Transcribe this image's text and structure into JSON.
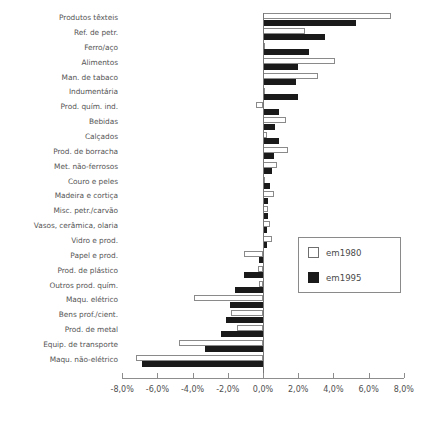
{
  "chart_data": {
    "type": "bar",
    "orientation": "horizontal",
    "title": "",
    "subtitle": "",
    "xlabel": "",
    "ylabel": "",
    "xlim": [
      -8,
      8
    ],
    "xticks": [
      -8,
      -6,
      -4,
      -2,
      0,
      2,
      4,
      6,
      8
    ],
    "xticklabels": [
      "-8,0%",
      "-6,0%",
      "-4,0%",
      "-2,0%",
      "0,0%",
      "2,0%",
      "4,0%",
      "6,0%",
      "8,0%"
    ],
    "grid": false,
    "legend_position": "center-right",
    "categories": [
      "Produtos têxteis",
      "Ref. de petr.",
      "Ferro/aço",
      "Alimentos",
      "Man. de tabaco",
      "Indumentária",
      "Prod. quím. ind.",
      "Bebidas",
      "Calçados",
      "Prod. de borracha",
      "Met. não-ferrosos",
      "Couro e peles",
      "Madeira e cortiça",
      "Misc. petr./carvão",
      "Vasos, cerâmica, olaria",
      "Vidro e prod.",
      "Papel e prod.",
      "Prod. de plástico",
      "Outros prod. quím.",
      "Maqu. elétrico",
      "Bens prof./cient.",
      "Prod. de metal",
      "Equip. de transporte",
      "Maqu. não-elétrico"
    ],
    "series": [
      {
        "name": "em1980",
        "color": "#ffffff",
        "edgecolor": "#8a8a8a",
        "values": [
          7.3,
          2.4,
          0.1,
          4.1,
          3.1,
          0.1,
          -0.4,
          1.3,
          0.2,
          1.4,
          0.8,
          0.1,
          0.6,
          0.3,
          0.4,
          0.5,
          -1.1,
          -0.3,
          -0.2,
          -3.9,
          -1.8,
          -1.5,
          -4.8,
          -7.2
        ]
      },
      {
        "name": "em1995",
        "color": "#1a1a1a",
        "edgecolor": "#1a1a1a",
        "values": [
          5.3,
          3.5,
          2.6,
          2.0,
          1.9,
          2.0,
          0.9,
          0.7,
          0.9,
          0.6,
          0.5,
          0.4,
          0.3,
          0.3,
          0.2,
          0.2,
          -0.2,
          -1.1,
          -1.6,
          -1.9,
          -2.1,
          -2.4,
          -3.3,
          -6.9
        ]
      }
    ]
  },
  "legend": {
    "entries": [
      {
        "label": "em1980"
      },
      {
        "label": "em1995"
      }
    ]
  }
}
